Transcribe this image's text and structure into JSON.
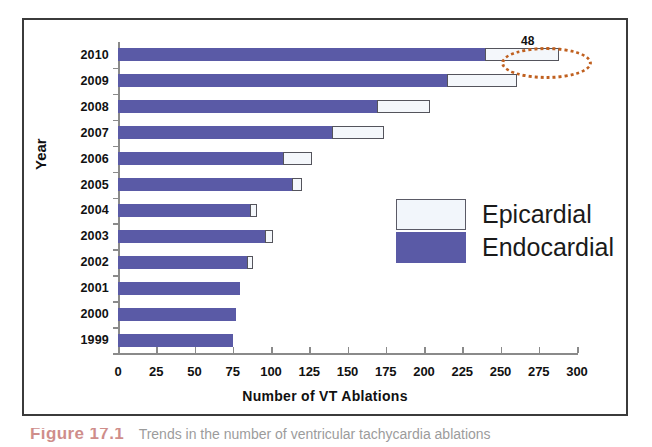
{
  "figure": {
    "caption_label": "Figure 17.1",
    "caption_rest": "Trends in the number of ventricular tachycardia ablations"
  },
  "chart_data": {
    "type": "bar",
    "orientation": "horizontal",
    "stacked": true,
    "title": "",
    "xlabel": "Number of VT Ablations",
    "ylabel": "Year",
    "xlim": [
      0,
      300
    ],
    "xticks": [
      0,
      25,
      50,
      75,
      100,
      125,
      150,
      175,
      200,
      225,
      250,
      275,
      300
    ],
    "xtick_labels": [
      "0",
      "25",
      "50",
      "75",
      "100",
      "125",
      "150",
      "175",
      "200",
      "225",
      "250",
      "275",
      "300"
    ],
    "grid": false,
    "legend_position": "center-right",
    "categories": [
      "2010",
      "2009",
      "2008",
      "2007",
      "2006",
      "2005",
      "2004",
      "2003",
      "2002",
      "2001",
      "2000",
      "1999"
    ],
    "series": [
      {
        "name": "Endocardial",
        "color": "#5a5aa6",
        "values": [
          240,
          215,
          169,
          140,
          108,
          114,
          86,
          96,
          84,
          80,
          77,
          75
        ]
      },
      {
        "name": "Epicardial",
        "color": "#f2f6fb",
        "values": [
          48,
          46,
          35,
          34,
          19,
          6,
          5,
          5,
          4,
          0,
          0,
          0
        ]
      }
    ],
    "totals": [
      288,
      261,
      204,
      174,
      127,
      120,
      91,
      101,
      88,
      80,
      77,
      75
    ],
    "annotations": [
      {
        "text": "48",
        "target_category": "2010",
        "target_series": "Epicardial",
        "marker": "dotted-ellipse",
        "marker_color": "#c0601f"
      }
    ]
  },
  "legend": {
    "items": [
      {
        "label": "Epicardial",
        "swatch": "white-box"
      },
      {
        "label": "Endocardial",
        "swatch": "blue-box"
      }
    ]
  }
}
